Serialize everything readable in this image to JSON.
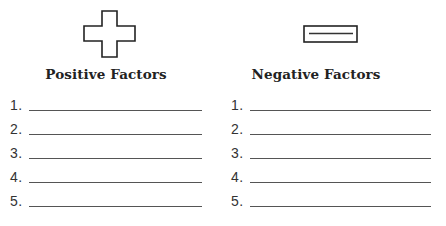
{
  "columns": [
    {
      "icon": "plus-icon",
      "heading": "Positive Factors",
      "items": [
        {
          "number": "1.",
          "value": ""
        },
        {
          "number": "2.",
          "value": ""
        },
        {
          "number": "3.",
          "value": ""
        },
        {
          "number": "4.",
          "value": ""
        },
        {
          "number": "5.",
          "value": ""
        }
      ]
    },
    {
      "icon": "minus-icon",
      "heading": "Negative Factors",
      "items": [
        {
          "number": "1.",
          "value": ""
        },
        {
          "number": "2.",
          "value": ""
        },
        {
          "number": "3.",
          "value": ""
        },
        {
          "number": "4.",
          "value": ""
        },
        {
          "number": "5.",
          "value": ""
        }
      ]
    }
  ]
}
